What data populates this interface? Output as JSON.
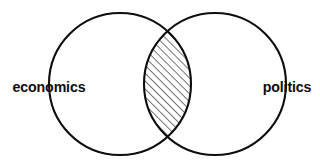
{
  "diagram": {
    "type": "venn",
    "title": "",
    "background_color": "#ffffff",
    "stroke_color": "#0d0d0d",
    "sets": [
      {
        "id": "left",
        "label": "economics",
        "label_x": 49,
        "label_y": 88,
        "label_anchor": "middle",
        "center_x": 120,
        "center_y": 84,
        "radius": 71,
        "fill": "none"
      },
      {
        "id": "right",
        "label": "politics",
        "label_x": 287,
        "label_y": 88,
        "label_anchor": "middle",
        "center_x": 215,
        "center_y": 84,
        "radius": 71,
        "fill": "none"
      }
    ],
    "intersection": {
      "label": "",
      "fill_pattern": "diagonal-hatch",
      "hatch_angle_deg": 45,
      "hatch_direction": "lower-left-to-upper-right",
      "hatch_spacing_px": 5.6,
      "hatch_color": "#0d0d0d",
      "top_crossing_x": 160,
      "top_crossing_y": 34,
      "bottom_crossing_x": 160,
      "bottom_crossing_y": 134
    }
  }
}
